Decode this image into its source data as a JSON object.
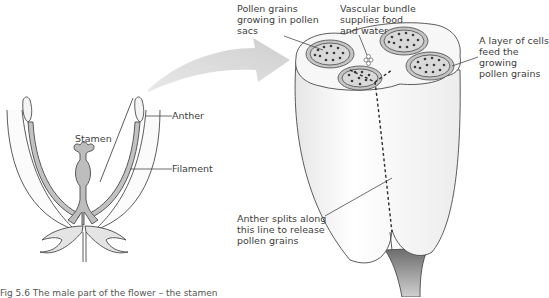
{
  "figure": {
    "caption": "Fig 5.6  The male part of the flower – the stamen",
    "colors": {
      "outline": "#4a4a4a",
      "fill_grey": "#bdbdbd",
      "arrow_grey": "#d4d4d4",
      "anther_fill": "#f4f4f4",
      "pollen_sac": "#b0b0b0",
      "pollen_grain": "#3a3a3a"
    }
  },
  "left_diagram": {
    "labels": {
      "anther": "Anther",
      "stamen": "Stamen",
      "filament": "Filament"
    }
  },
  "right_diagram": {
    "labels": {
      "pollen_sacs_line1": "Pollen grains",
      "pollen_sacs_line2": "growing in pollen",
      "pollen_sacs_line3": "sacs",
      "vascular_line1": "Vascular bundle",
      "vascular_line2": "supplies food",
      "vascular_line3": "and water",
      "cells_line1": "A layer of cells",
      "cells_line2": "feed the",
      "cells_line3": "growing",
      "cells_line4": "pollen grains",
      "split_line1": "Anther splits along",
      "split_line2": "this line to release",
      "split_line3": "pollen grains"
    }
  }
}
